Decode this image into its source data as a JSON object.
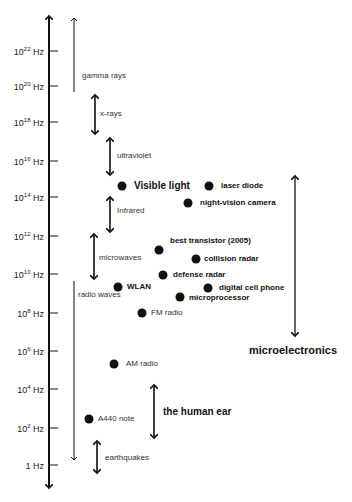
{
  "axis": {
    "ticks": [
      {
        "base": "10",
        "exp": "22",
        "unit": "Hz",
        "y": 51
      },
      {
        "base": "10",
        "exp": "20",
        "unit": "Hz",
        "y": 86
      },
      {
        "base": "10",
        "exp": "18",
        "unit": "Hz",
        "y": 122
      },
      {
        "base": "10",
        "exp": "16",
        "unit": "Hz",
        "y": 161
      },
      {
        "base": "10",
        "exp": "14",
        "unit": "Hz",
        "y": 197
      },
      {
        "base": "10",
        "exp": "12",
        "unit": "Hz",
        "y": 236
      },
      {
        "base": "10",
        "exp": "10",
        "unit": "Hz",
        "y": 274
      },
      {
        "base": "10",
        "exp": "8",
        "unit": "Hz",
        "y": 313
      },
      {
        "base": "10",
        "exp": "6",
        "unit": "Hz",
        "y": 351
      },
      {
        "base": "10",
        "exp": "4",
        "unit": "Hz",
        "y": 389
      },
      {
        "base": "10",
        "exp": "2",
        "unit": "Hz",
        "y": 428
      },
      {
        "base": "1",
        "exp": "",
        "unit": "Hz",
        "y": 465
      }
    ]
  },
  "bands": {
    "gamma_rays": "gamma rays",
    "x_rays": "x-rays",
    "ultraviolet": "ultraviolet",
    "infrared": "Infrared",
    "microwaves": "microwaves",
    "radio_waves": "radio waves",
    "earthquakes": "earthquakes",
    "human_ear": "the human ear",
    "microelectronics": "microelectronics"
  },
  "points": {
    "visible_light": "Visible light",
    "laser_diode": "laser diode",
    "night_vision": "night-vision camera",
    "best_transistor": "best transistor (2005)",
    "collision_radar": "collision radar",
    "defense_radar": "defense radar",
    "wlan": "WLAN",
    "digital_cell_phone": "digital cell phone",
    "microprocessor": "microprocessor",
    "fm_radio": "FM radio",
    "am_radio": "AM radio",
    "a440_note": "A440 note"
  },
  "colors": {
    "ink": "#111111",
    "label": "#333333",
    "background": "#ffffff"
  }
}
